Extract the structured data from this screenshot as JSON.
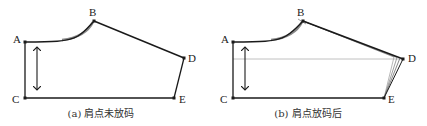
{
  "panels": [
    {
      "id": "a",
      "caption": "(a) 肩点未放码",
      "points": {
        "A": {
          "label": "A",
          "x": 25,
          "y": 42
        },
        "B": {
          "label": "B",
          "x": 94,
          "y": 21
        },
        "C": {
          "label": "C",
          "x": 25,
          "y": 98
        },
        "D": {
          "label": "D",
          "x": 184,
          "y": 58
        },
        "E": {
          "label": "E",
          "x": 174,
          "y": 98
        }
      }
    },
    {
      "id": "b",
      "caption": "(b) 肩点放码后",
      "points": {
        "A": {
          "label": "A",
          "x": 233,
          "y": 42
        },
        "B": {
          "label": "B",
          "x": 303,
          "y": 21
        },
        "C": {
          "label": "C",
          "x": 233,
          "y": 98
        },
        "D": {
          "label": "D",
          "x": 403,
          "y": 59
        },
        "E": {
          "label": "E",
          "x": 384,
          "y": 98
        }
      }
    }
  ],
  "colors": {
    "line": "#1a1a1a",
    "grade_line": "#888888",
    "guide_line": "#b0b0b0"
  }
}
